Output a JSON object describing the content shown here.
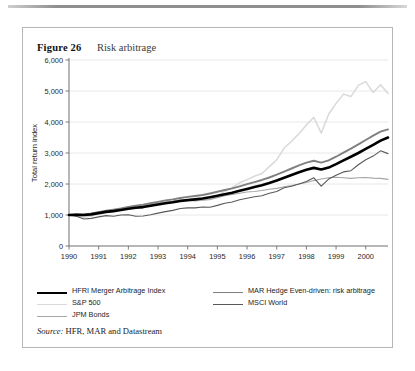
{
  "figure": {
    "number": "Figure 26",
    "title": "Risk arbitrage",
    "source_label": "Source:",
    "source_text": "HFR, MAR and Datastream"
  },
  "legend": {
    "entries": [
      {
        "label": "HFRI Merger Arbitrage Index",
        "color": "#000000",
        "width": 2.6
      },
      {
        "label": "MAR Hedge Even-driven: risk arbitrage",
        "color": "#808080",
        "width": 1.9
      },
      {
        "label": "S&P 500",
        "color": "#d9d9d9",
        "width": 1.5
      },
      {
        "label": "MSCI World",
        "color": "#595959",
        "width": 1.1
      },
      {
        "label": "JPM Bonds",
        "color": "#a6a6a6",
        "width": 1.1
      }
    ]
  },
  "chart_data": {
    "type": "line",
    "title": "Risk arbitrage",
    "xlabel": "",
    "ylabel": "Total return index",
    "xlim": [
      1990,
      2000.75
    ],
    "ylim": [
      0,
      6000
    ],
    "ytick_labels": [
      "0",
      "1,000",
      "2,000",
      "3,000",
      "4,000",
      "5,000",
      "6,000"
    ],
    "yticks": [
      0,
      1000,
      2000,
      3000,
      4000,
      5000,
      6000
    ],
    "xticks": [
      1990,
      1991,
      1992,
      1993,
      1994,
      1995,
      1996,
      1997,
      1998,
      1999,
      2000
    ],
    "xtick_labels": [
      "1990",
      "1991",
      "1992",
      "1993",
      "1994",
      "1995",
      "1996",
      "1997",
      "1998",
      "1999",
      "2000"
    ],
    "grid": "horizontal",
    "legend_position": "below",
    "x": [
      1990.0,
      1990.25,
      1990.5,
      1990.75,
      1991.0,
      1991.25,
      1991.5,
      1991.75,
      1992.0,
      1992.25,
      1992.5,
      1992.75,
      1993.0,
      1993.25,
      1993.5,
      1993.75,
      1994.0,
      1994.25,
      1994.5,
      1994.75,
      1995.0,
      1995.25,
      1995.5,
      1995.75,
      1996.0,
      1996.25,
      1996.5,
      1996.75,
      1997.0,
      1997.25,
      1997.5,
      1997.75,
      1998.0,
      1998.25,
      1998.5,
      1998.75,
      1999.0,
      1999.25,
      1999.5,
      1999.75,
      2000.0,
      2000.25,
      2000.5,
      2000.75
    ],
    "series": [
      {
        "name": "HFRI Merger Arbitrage Index",
        "color": "#000000",
        "width": 2.6,
        "values": [
          1000,
          1010,
          1000,
          1020,
          1060,
          1100,
          1125,
          1160,
          1200,
          1235,
          1255,
          1300,
          1340,
          1380,
          1410,
          1450,
          1480,
          1505,
          1530,
          1575,
          1620,
          1670,
          1720,
          1780,
          1840,
          1900,
          1960,
          2030,
          2110,
          2200,
          2290,
          2380,
          2460,
          2520,
          2470,
          2530,
          2640,
          2760,
          2880,
          3000,
          3130,
          3260,
          3400,
          3500
        ]
      },
      {
        "name": "MAR Hedge Even-driven: risk arbitrage",
        "color": "#808080",
        "width": 1.9,
        "values": [
          1000,
          1020,
          1010,
          1040,
          1090,
          1140,
          1175,
          1215,
          1260,
          1300,
          1330,
          1380,
          1425,
          1470,
          1505,
          1550,
          1585,
          1615,
          1645,
          1695,
          1750,
          1805,
          1860,
          1925,
          1995,
          2060,
          2130,
          2210,
          2300,
          2400,
          2500,
          2600,
          2690,
          2750,
          2690,
          2760,
          2880,
          3010,
          3140,
          3280,
          3420,
          3560,
          3690,
          3760
        ]
      },
      {
        "name": "S&P 500",
        "color": "#d9d9d9",
        "width": 1.5,
        "values": [
          1000,
          980,
          930,
          960,
          1060,
          1100,
          1110,
          1180,
          1240,
          1230,
          1260,
          1320,
          1370,
          1400,
          1430,
          1480,
          1480,
          1450,
          1490,
          1500,
          1620,
          1760,
          1880,
          2040,
          2140,
          2250,
          2340,
          2560,
          2780,
          3160,
          3380,
          3620,
          3900,
          4150,
          3640,
          4250,
          4600,
          4900,
          4820,
          5180,
          5300,
          4950,
          5200,
          4920
        ]
      },
      {
        "name": "MSCI World",
        "color": "#595959",
        "width": 1.1,
        "values": [
          1000,
          960,
          870,
          890,
          940,
          980,
          960,
          1000,
          1010,
          960,
          970,
          1010,
          1060,
          1110,
          1150,
          1210,
          1230,
          1230,
          1260,
          1250,
          1310,
          1380,
          1420,
          1490,
          1540,
          1590,
          1620,
          1700,
          1760,
          1880,
          1930,
          2000,
          2080,
          2200,
          1930,
          2160,
          2280,
          2390,
          2430,
          2620,
          2780,
          2900,
          3070,
          2980
        ]
      },
      {
        "name": "JPM Bonds",
        "color": "#a6a6a6",
        "width": 1.1,
        "values": [
          1000,
          1020,
          1030,
          1060,
          1100,
          1130,
          1150,
          1190,
          1230,
          1250,
          1280,
          1330,
          1380,
          1420,
          1450,
          1490,
          1480,
          1460,
          1480,
          1500,
          1560,
          1620,
          1660,
          1700,
          1740,
          1760,
          1790,
          1830,
          1860,
          1910,
          1950,
          2000,
          2050,
          2110,
          2160,
          2200,
          2220,
          2200,
          2180,
          2200,
          2210,
          2190,
          2180,
          2150
        ]
      }
    ]
  }
}
